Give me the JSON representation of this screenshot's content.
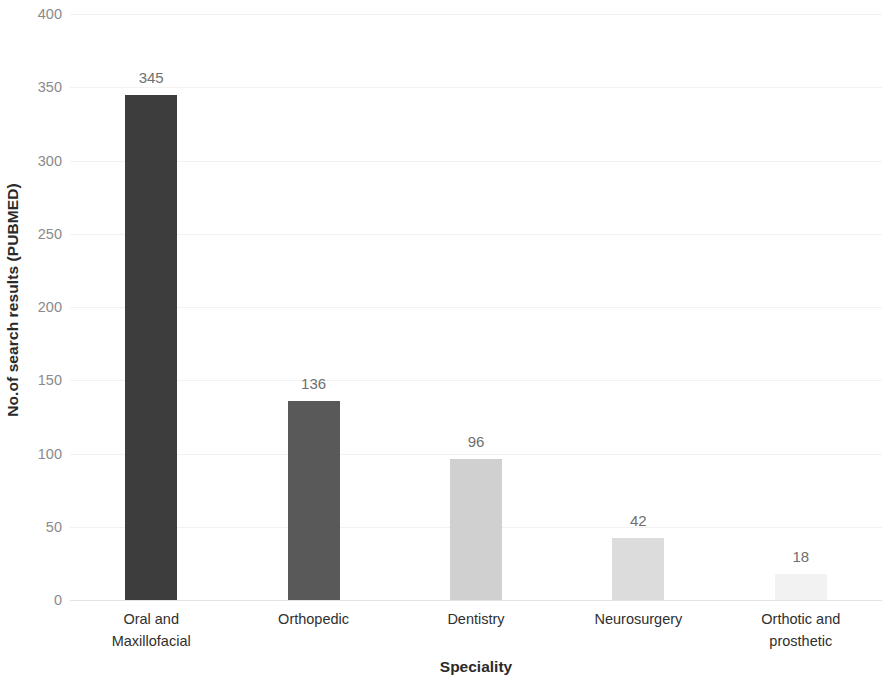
{
  "chart_data": {
    "type": "bar",
    "title": "",
    "xlabel": "Speciality",
    "ylabel": "No.of search results (PUBMED)",
    "categories": [
      "Oral and Maxillofacial",
      "Orthopedic",
      "Dentistry",
      "Neurosurgery",
      "Orthotic and prosthetic"
    ],
    "category_lines": [
      [
        "Oral and",
        "Maxillofacial"
      ],
      [
        "Orthopedic",
        ""
      ],
      [
        "Dentistry",
        ""
      ],
      [
        "Neurosurgery",
        ""
      ],
      [
        "Orthotic and",
        "prosthetic"
      ]
    ],
    "values": [
      345,
      136,
      96,
      42,
      18
    ],
    "value_labels": [
      "345",
      "136",
      "96",
      "42",
      "18"
    ],
    "bar_colors": [
      "#3d3d3d",
      "#595959",
      "#d0d0d0",
      "#dcdcdc",
      "#f2f2f2"
    ],
    "ylim": [
      0,
      400
    ],
    "ytick_step": 50,
    "ytick_labels": [
      "400",
      "350",
      "300",
      "250",
      "200",
      "150",
      "100",
      "50",
      "0"
    ],
    "ytick_values": [
      400,
      350,
      300,
      250,
      200,
      150,
      100,
      50,
      0
    ],
    "grid": true,
    "grid_color": "#f2f2f2",
    "legend": false,
    "background": "#ffffff",
    "tick_label_color": "#8a8a8a",
    "value_label_color": "#6f6f6f",
    "axis_title_color": "#2a2a2a"
  }
}
